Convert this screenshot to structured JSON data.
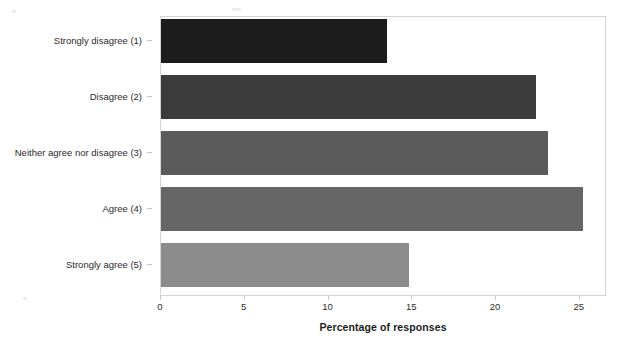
{
  "chart_data": {
    "type": "bar",
    "orientation": "horizontal",
    "title": "",
    "subtitle": "",
    "xlabel": "Percentage of responses",
    "ylabel": "",
    "categories": [
      "Strongly disagree (1)",
      "Disagree (2)",
      "Neither agree nor disagree (3)",
      "Agree (4)",
      "Strongly agree (5)"
    ],
    "values": [
      13.5,
      22.4,
      23.1,
      25.2,
      14.8
    ],
    "bar_colors": [
      "#1c1c1c",
      "#3b3b3b",
      "#5b5b5b",
      "#656565",
      "#8c8c8c"
    ],
    "xlim": [
      0,
      26.5
    ],
    "xticks": [
      0,
      5,
      10,
      15,
      20,
      25
    ],
    "xtick_labels": [
      "0",
      "5",
      "10",
      "15",
      "20",
      "25"
    ],
    "grid": false,
    "legend": false,
    "legend_position": "none",
    "frame_color": "#d4d4d4",
    "background_color": "#ffffff",
    "text_color": "#2b2b2b"
  },
  "axis": {
    "x_title": "Percentage of responses"
  }
}
